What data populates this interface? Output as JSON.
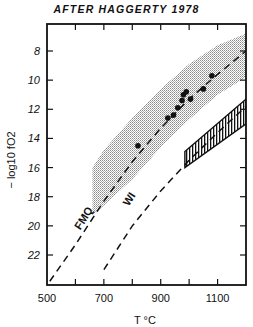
{
  "chart_data": {
    "type": "scatter",
    "title": "AFTER HAGGERTY 1978",
    "xlabel": "T °C",
    "ylabel": "− log10 fO2",
    "xlim": [
      500,
      1200
    ],
    "ylim": [
      24,
      6
    ],
    "y_inverted": true,
    "x_ticks": [
      500,
      600,
      700,
      800,
      900,
      1000,
      1100,
      1200
    ],
    "x_tick_labels": [
      "500",
      "700",
      "900",
      "1100"
    ],
    "y_ticks": [
      8,
      10,
      12,
      14,
      16,
      18,
      20,
      22
    ],
    "y_tick_labels": [
      "8",
      "10",
      "12",
      "14",
      "16",
      "18",
      "20",
      "22"
    ],
    "grid": false,
    "series": [
      {
        "name": "Data points",
        "kind": "scatter",
        "x": [
          820,
          925,
          945,
          960,
          975,
          980,
          990,
          1005,
          1050,
          1080
        ],
        "y": [
          14.5,
          12.6,
          12.4,
          11.9,
          11.4,
          11.0,
          10.8,
          11.3,
          10.6,
          9.7
        ]
      },
      {
        "name": "FMQ",
        "kind": "dashed-line",
        "x": [
          510,
          600,
          700,
          800,
          900,
          1000,
          1100,
          1200
        ],
        "y": [
          23.8,
          21.3,
          18.3,
          15.6,
          13.3,
          11.3,
          9.6,
          8.0
        ]
      },
      {
        "name": "WI",
        "kind": "dashed-line",
        "x": [
          700,
          800,
          900,
          1000,
          1100,
          1200
        ],
        "y": [
          23.0,
          20.0,
          17.6,
          15.5,
          13.6,
          11.8
        ]
      }
    ],
    "regions": [
      {
        "name": "Stippled field around FMQ",
        "kind": "stippled",
        "upper": {
          "x": [
            660,
            700,
            800,
            900,
            1000,
            1100,
            1200
          ],
          "y": [
            16.0,
            14.8,
            12.6,
            10.6,
            8.9,
            7.6,
            6.8
          ]
        },
        "lower": {
          "x": [
            660,
            700,
            800,
            900,
            1000,
            1100,
            1200
          ],
          "y": [
            19.3,
            18.6,
            16.8,
            14.6,
            12.7,
            11.0,
            9.8
          ]
        }
      },
      {
        "name": "Hatched field",
        "kind": "hatched",
        "polygon": {
          "x": [
            985,
            1200,
            1200,
            985
          ],
          "y": [
            14.9,
            11.3,
            13.0,
            16.0
          ]
        }
      }
    ],
    "annotations": [
      {
        "text": "FMQ",
        "x": 640,
        "y": 19.6,
        "rotation": -58
      },
      {
        "text": "WI",
        "x": 800,
        "y": 18.3,
        "rotation": -58
      }
    ]
  }
}
